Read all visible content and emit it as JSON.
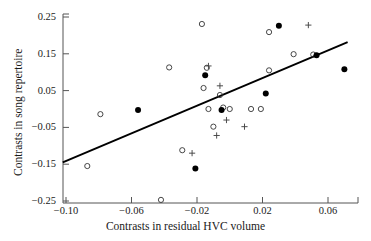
{
  "chart_data": {
    "type": "scatter",
    "title": "",
    "xlabel": "Contrasts in residual HVC volume",
    "ylabel": "Contrasts in song repertoire",
    "xlim": [
      -0.105,
      0.075
    ],
    "ylim": [
      -0.25,
      0.25
    ],
    "xticks": [
      -0.1,
      -0.06,
      -0.02,
      0.02,
      0.06
    ],
    "xticklabels": [
      "-0.10",
      "-0.06",
      "-0.02",
      "0.02",
      "0.06"
    ],
    "yticks": [
      -0.25,
      -0.15,
      -0.05,
      0.05,
      0.15,
      0.25
    ],
    "yticklabels": [
      "-0.25",
      "-0.15",
      "-0.05",
      "0.05",
      "0.15",
      "0.25"
    ],
    "grid": false,
    "legend": "none",
    "marker_colors": {
      "open_circle": "#333333",
      "filled_circle": "#000000",
      "plus": "#444444"
    },
    "series": [
      {
        "name": "open circle",
        "marker": "open-circle",
        "points": [
          {
            "x": -0.087,
            "y": -0.155
          },
          {
            "x": -0.079,
            "y": -0.014
          },
          {
            "x": -0.042,
            "y": -0.247
          },
          {
            "x": -0.037,
            "y": 0.113
          },
          {
            "x": -0.029,
            "y": -0.112
          },
          {
            "x": -0.017,
            "y": 0.231
          },
          {
            "x": -0.016,
            "y": 0.057
          },
          {
            "x": -0.014,
            "y": 0.112
          },
          {
            "x": -0.013,
            "y": 0.0
          },
          {
            "x": -0.01,
            "y": -0.048
          },
          {
            "x": -0.006,
            "y": 0.038
          },
          {
            "x": -0.004,
            "y": 0.004
          },
          {
            "x": 0.0,
            "y": 0.0
          },
          {
            "x": 0.013,
            "y": 0.0
          },
          {
            "x": 0.019,
            "y": 0.0
          },
          {
            "x": 0.024,
            "y": 0.105
          },
          {
            "x": 0.024,
            "y": 0.209
          },
          {
            "x": 0.039,
            "y": 0.149
          },
          {
            "x": 0.051,
            "y": 0.148
          }
        ]
      },
      {
        "name": "filled circle",
        "marker": "filled-circle",
        "points": [
          {
            "x": -0.056,
            "y": -0.003
          },
          {
            "x": -0.021,
            "y": -0.162
          },
          {
            "x": -0.015,
            "y": 0.092
          },
          {
            "x": -0.005,
            "y": -0.003
          },
          {
            "x": 0.022,
            "y": 0.042
          },
          {
            "x": 0.03,
            "y": 0.226
          },
          {
            "x": 0.053,
            "y": 0.146
          },
          {
            "x": 0.07,
            "y": 0.108
          }
        ]
      },
      {
        "name": "plus",
        "marker": "plus",
        "points": [
          {
            "x": -0.023,
            "y": -0.12
          },
          {
            "x": -0.013,
            "y": 0.117
          },
          {
            "x": -0.008,
            "y": -0.072
          },
          {
            "x": -0.006,
            "y": 0.063
          },
          {
            "x": -0.002,
            "y": -0.03
          },
          {
            "x": 0.009,
            "y": -0.048
          },
          {
            "x": 0.048,
            "y": 0.228
          }
        ]
      }
    ],
    "regression_line": {
      "x_start": -0.102,
      "y_start": -0.145,
      "x_end": 0.072,
      "y_end": 0.182
    }
  },
  "axes": {
    "y_title": "Contrasts in song repertoire",
    "x_title": "Contrasts in residual HVC volume"
  }
}
